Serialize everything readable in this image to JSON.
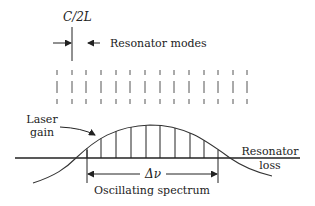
{
  "diagram": {
    "spacing_label": "C/2L",
    "modes_label": "Resonator modes",
    "gain_label_line1": "Laser",
    "gain_label_line2": "gain",
    "loss_label_line1": "Resonator",
    "loss_label_line2": "loss",
    "bandwidth_label": "Δν",
    "spectrum_label": "Oscillating spectrum",
    "mode_positions_x": [
      57,
      72,
      86,
      101,
      116,
      130,
      145,
      160,
      174,
      189,
      204,
      218,
      233,
      247
    ],
    "oscillating_mode_positions_x": [
      87,
      101,
      116,
      131,
      146,
      160,
      175,
      190,
      204
    ],
    "colors": {
      "line": "#222222",
      "mode_line": "#555555",
      "background": "#ffffff"
    }
  }
}
